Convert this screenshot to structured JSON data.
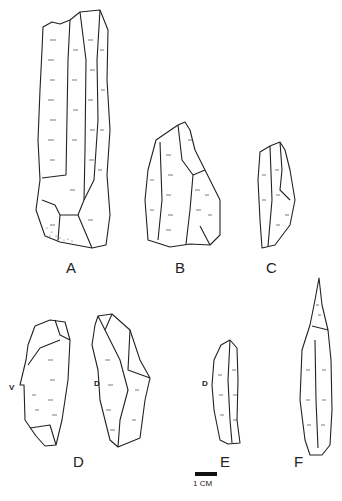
{
  "figure": {
    "artifacts": [
      {
        "id": "A",
        "label": "A"
      },
      {
        "id": "B",
        "label": "B"
      },
      {
        "id": "C",
        "label": "C"
      },
      {
        "id": "D",
        "label": "D",
        "views": [
          {
            "label": "V"
          },
          {
            "label": "D"
          }
        ]
      },
      {
        "id": "E",
        "label": "E",
        "views": [
          {
            "label": "D"
          }
        ]
      },
      {
        "id": "F",
        "label": "F"
      }
    ],
    "scale": {
      "label": "1 CM"
    }
  }
}
